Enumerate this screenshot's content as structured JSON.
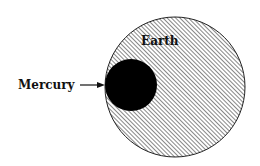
{
  "diagram": {
    "bodies": [
      {
        "name": "Earth",
        "label": "Earth",
        "fill": "hatched",
        "color": "#000000"
      },
      {
        "name": "Mercury",
        "label": "Mercury",
        "fill": "solid",
        "color": "#000000"
      }
    ],
    "labels": {
      "earth": "Earth",
      "mercury": "Mercury"
    }
  }
}
